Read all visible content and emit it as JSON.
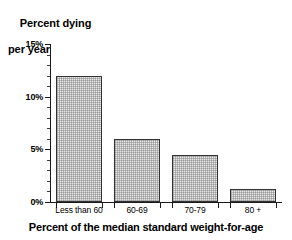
{
  "chart_data": {
    "type": "bar",
    "title": "",
    "ylabel": "Percent dying per year",
    "ylabel_lines": [
      "Percent dying",
      "per year"
    ],
    "xlabel": "Percent of the median standard weight-for-age",
    "categories": [
      "Less than 60",
      "60-69",
      "70-79",
      "80 +"
    ],
    "values": [
      12.0,
      6.0,
      4.5,
      1.2
    ],
    "ylim": [
      0,
      15
    ],
    "ytick_values": [
      0,
      5,
      10,
      15
    ],
    "ytick_labels": [
      "0%",
      "5%",
      "10%",
      "15%"
    ],
    "yminor_step": 1,
    "grid": false,
    "legend": null,
    "bar_fill_color": "#e9e9e9",
    "bar_edge_color": "#333333",
    "axis_color": "#1a1a1a"
  },
  "axis": {
    "y_title_line1": "Percent dying",
    "y_title_line2": "per year",
    "x_title": "Percent of the median standard weight-for-age"
  }
}
